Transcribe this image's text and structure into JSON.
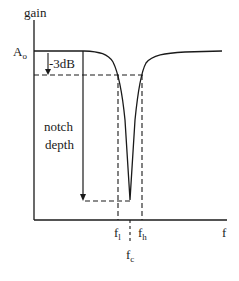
{
  "diagram": {
    "y_axis_label": "gain",
    "x_axis_label": "f",
    "gain_level_label": "A",
    "gain_level_subscript": "o",
    "attenuation_label": "-3dB",
    "depth_label_line1": "notch",
    "depth_label_line2": "depth",
    "freq_low": {
      "base": "f",
      "sub": "l"
    },
    "freq_center": {
      "base": "f",
      "sub": "c"
    },
    "freq_high": {
      "base": "f",
      "sub": "h"
    }
  },
  "colors": {
    "ink": "#1a1a1a",
    "background": "#ffffff"
  }
}
